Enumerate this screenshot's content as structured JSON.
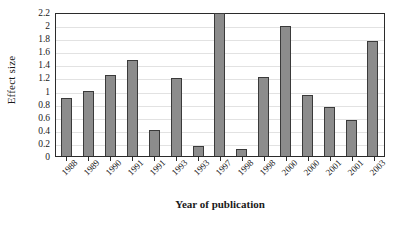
{
  "chart_data": {
    "type": "bar",
    "title": "",
    "xlabel": "Year of publication",
    "ylabel": "Effect size",
    "ylim": [
      0,
      2.2
    ],
    "ytick_labels": [
      "2.2",
      "2",
      "1.8",
      "1.6",
      "1.4",
      "1.2",
      "1",
      "0.8",
      "0.6",
      "0.4",
      "0.2",
      "0"
    ],
    "ytick_values": [
      2.2,
      2,
      1.8,
      1.6,
      1.4,
      1.2,
      1,
      0.8,
      0.6,
      0.4,
      0.2,
      0
    ],
    "grid": true,
    "grid_axis": "y",
    "legend": false,
    "categories": [
      "1988",
      "1989",
      "1990",
      "1991",
      "1991",
      "1993",
      "1993",
      "1997",
      "1998",
      "1998",
      "2000",
      "2000",
      "2001",
      "2001",
      "2003"
    ],
    "values": [
      0.88,
      1.0,
      1.24,
      1.46,
      0.4,
      1.19,
      0.16,
      2.18,
      0.1,
      1.2,
      1.98,
      0.93,
      0.75,
      0.55,
      1.76
    ],
    "bar_color": "#8c8c8c",
    "bar_edge_color": "#3a3a3a",
    "axis_color": "#2b2b2b",
    "grid_color": "#e2e2e2",
    "background_color": "#ffffff"
  }
}
